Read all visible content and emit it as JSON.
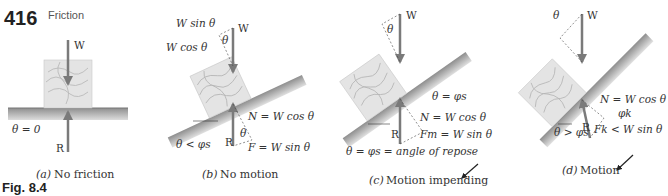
{
  "header": {
    "page_number": "416",
    "section_title": "Friction"
  },
  "figure_label": "Fig. 8.4",
  "panels": [
    {
      "id": "a",
      "caption_letter": "(a)",
      "caption": "No friction",
      "labels": {
        "weight": "W",
        "reaction": "R",
        "angle": "θ = 0"
      }
    },
    {
      "id": "b",
      "caption_letter": "(b)",
      "caption": "No motion",
      "labels": {
        "weight": "W",
        "reaction": "R",
        "wsin": "W sin θ",
        "wcos": "W cos θ",
        "theta": "θ",
        "normal": "N = W cos θ",
        "friction": "F = W sin θ",
        "condition": "θ < φs"
      }
    },
    {
      "id": "c",
      "caption_letter": "(c)",
      "caption": "Motion impending",
      "labels": {
        "weight": "W",
        "reaction": "R",
        "theta": "θ",
        "theta_eq": "θ = φs",
        "normal": "N = W cos θ",
        "friction": "Fm = W sin θ",
        "repose": "θ = φs = angle of repose"
      }
    },
    {
      "id": "d",
      "caption_letter": "(d)",
      "caption": "Motion",
      "labels": {
        "weight": "W",
        "reaction": "R",
        "theta": "θ",
        "phik": "φk",
        "normal": "N = W cos θ",
        "friction": "Fk < W sin θ",
        "condition": "θ > φs"
      }
    }
  ],
  "colors": {
    "arrow": "#7a7a7a",
    "block": "#e4e4e4",
    "grain": "#b5b5b5",
    "surface_top": "#9a9a9a",
    "surface_bottom": "#d6d6d6"
  }
}
